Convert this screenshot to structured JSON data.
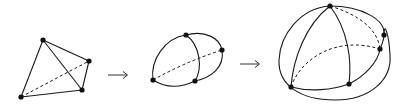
{
  "diagram": {
    "stages": [
      {
        "name": "tetrahedron",
        "vertices": [
          [
            43,
            40
          ],
          [
            89,
            61
          ],
          [
            82,
            90
          ],
          [
            21,
            97
          ]
        ],
        "solid_edges": [
          [
            0,
            1
          ],
          [
            0,
            2
          ],
          [
            0,
            3
          ],
          [
            1,
            2
          ],
          [
            2,
            3
          ]
        ],
        "dashed_edges": [
          [
            3,
            1
          ]
        ]
      },
      {
        "name": "curved-cell",
        "vertices": [
          [
            186,
            35
          ],
          [
            222,
            50
          ],
          [
            195,
            81
          ],
          [
            153,
            80
          ]
        ]
      },
      {
        "name": "sphere-subdivision",
        "vertices": [
          [
            330,
            6
          ],
          [
            384,
            35
          ],
          [
            380,
            49
          ],
          [
            349,
            84
          ],
          [
            291,
            87
          ]
        ]
      }
    ],
    "arrows": [
      {
        "from_stage": 0,
        "to_stage": 1,
        "glyph": "→"
      },
      {
        "from_stage": 1,
        "to_stage": 2,
        "glyph": "→"
      }
    ],
    "colors": {
      "stroke": "#1a1a1a",
      "vertex": "#111111",
      "background": "#ffffff"
    }
  }
}
